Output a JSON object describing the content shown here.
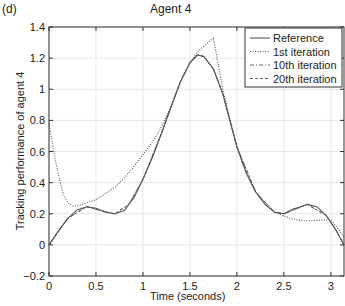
{
  "panel_label": "(d)",
  "chart_data": {
    "type": "line",
    "title": "Agent 4",
    "xlabel": "Time (seconds)",
    "ylabel": "Tracking performance of agent 4",
    "xlim": [
      0,
      3.14
    ],
    "ylim": [
      -0.2,
      1.4
    ],
    "xticks": [
      0,
      0.5,
      1,
      1.5,
      2,
      2.5,
      3
    ],
    "xtick_labels": [
      "0",
      "0.5",
      "1",
      "1.5",
      "2",
      "2.5",
      "3"
    ],
    "yticks": [
      -0.2,
      0,
      0.2,
      0.4,
      0.6,
      0.8,
      1,
      1.2,
      1.4
    ],
    "ytick_labels": [
      "-0.2",
      "0",
      "0.2",
      "0.4",
      "0.6",
      "0.8",
      "1",
      "1.2",
      "1.4"
    ],
    "grid": true,
    "legend_position": "upper right",
    "series": [
      {
        "name": "Reference",
        "style": "solid",
        "x": [
          0,
          0.1,
          0.2,
          0.3,
          0.4,
          0.5,
          0.6,
          0.7,
          0.8,
          0.9,
          1.0,
          1.1,
          1.2,
          1.3,
          1.4,
          1.5,
          1.58,
          1.65,
          1.75,
          1.85,
          2.0,
          2.1,
          2.2,
          2.3,
          2.4,
          2.5,
          2.6,
          2.75,
          2.85,
          2.95,
          3.05,
          3.14
        ],
        "values": [
          0,
          0.09,
          0.17,
          0.225,
          0.245,
          0.235,
          0.21,
          0.2,
          0.22,
          0.3,
          0.42,
          0.56,
          0.72,
          0.89,
          1.05,
          1.17,
          1.22,
          1.21,
          1.13,
          0.97,
          0.63,
          0.46,
          0.34,
          0.26,
          0.21,
          0.2,
          0.23,
          0.26,
          0.245,
          0.19,
          0.1,
          0
        ]
      },
      {
        "name": "1st iteration",
        "style": "dotted",
        "x": [
          0,
          0.05,
          0.1,
          0.15,
          0.2,
          0.25,
          0.3,
          0.4,
          0.5,
          0.6,
          0.7,
          0.8,
          0.9,
          1.0,
          1.1,
          1.18,
          1.3,
          1.4,
          1.5,
          1.58,
          1.75,
          1.85,
          2.0,
          2.1,
          2.2,
          2.3,
          2.4,
          2.5,
          2.6,
          2.7,
          2.8,
          2.9,
          3.0,
          3.07,
          3.14
        ],
        "values": [
          0.78,
          0.6,
          0.45,
          0.33,
          0.27,
          0.25,
          0.25,
          0.27,
          0.29,
          0.33,
          0.37,
          0.43,
          0.5,
          0.58,
          0.66,
          0.74,
          0.89,
          1.05,
          1.17,
          1.24,
          1.33,
          1.0,
          0.63,
          0.46,
          0.34,
          0.26,
          0.21,
          0.185,
          0.165,
          0.155,
          0.155,
          0.16,
          0.16,
          0.11,
          0.05
        ]
      },
      {
        "name": "10th iteration",
        "style": "dashdot",
        "x": [
          0,
          0.2,
          0.4,
          0.55,
          0.7,
          0.85,
          1.0,
          1.2,
          1.4,
          1.5,
          1.58,
          1.65,
          1.75,
          1.85,
          2.0,
          2.2,
          2.4,
          2.5,
          2.75,
          2.95,
          3.05,
          3.14
        ],
        "values": [
          0,
          0.17,
          0.245,
          0.22,
          0.2,
          0.26,
          0.42,
          0.72,
          1.05,
          1.17,
          1.225,
          1.21,
          1.13,
          0.97,
          0.63,
          0.34,
          0.21,
          0.2,
          0.26,
          0.19,
          0.1,
          0
        ]
      },
      {
        "name": "20th iteration",
        "style": "dashed",
        "x": [
          0,
          0.2,
          0.4,
          0.55,
          0.7,
          0.85,
          1.0,
          1.2,
          1.4,
          1.5,
          1.58,
          1.65,
          1.75,
          1.85,
          2.0,
          2.2,
          2.4,
          2.5,
          2.75,
          2.95,
          3.05,
          3.14
        ],
        "values": [
          0,
          0.17,
          0.245,
          0.22,
          0.2,
          0.26,
          0.42,
          0.72,
          1.05,
          1.17,
          1.22,
          1.21,
          1.13,
          0.97,
          0.63,
          0.34,
          0.21,
          0.2,
          0.26,
          0.19,
          0.1,
          0
        ]
      }
    ]
  },
  "colors": {
    "axis": "#333333",
    "grid": "#e6e6e6",
    "line": "#555555"
  }
}
